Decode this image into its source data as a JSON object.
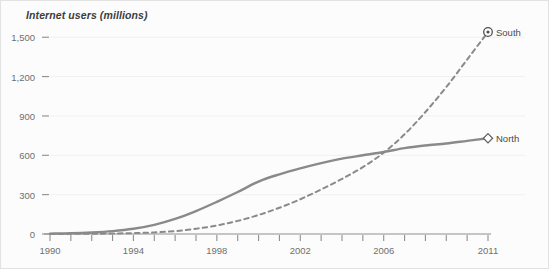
{
  "chart_data": {
    "type": "line",
    "title": "Internet users (millions)",
    "xlabel": "",
    "ylabel": "Internet users (millions)",
    "xlim": [
      1990,
      2011
    ],
    "ylim": [
      0,
      1600
    ],
    "grid": true,
    "legend_position": "right-inline",
    "y_ticks": [
      0,
      300,
      600,
      900,
      1200,
      1500
    ],
    "y_tick_labels": [
      "0",
      "300",
      "600",
      "900",
      "1,200",
      "1,500"
    ],
    "x_ticks": [
      1990,
      1991,
      1992,
      1993,
      1994,
      1995,
      1996,
      1997,
      1998,
      1999,
      2000,
      2001,
      2002,
      2003,
      2004,
      2005,
      2006,
      2007,
      2008,
      2009,
      2010,
      2011
    ],
    "x_tick_labels": [
      "1990",
      "1994",
      "1998",
      "2002",
      "2006",
      "2011"
    ],
    "x_labelled_ticks": [
      1990,
      1994,
      1998,
      2002,
      2006,
      2011
    ],
    "x": [
      1990,
      1991,
      1992,
      1993,
      1994,
      1995,
      1996,
      1997,
      1998,
      1999,
      2000,
      2001,
      2002,
      2003,
      2004,
      2005,
      2006,
      2007,
      2008,
      2009,
      2010,
      2011
    ],
    "series": [
      {
        "name": "North",
        "label": "North",
        "style": "solid",
        "color": "#8a8a8a",
        "marker": "diamond",
        "values": [
          3,
          6,
          12,
          22,
          40,
          70,
          115,
          175,
          245,
          320,
          400,
          455,
          500,
          540,
          575,
          600,
          625,
          655,
          675,
          690,
          710,
          730
        ]
      },
      {
        "name": "South",
        "label": "South",
        "style": "dashed",
        "color": "#8a8a8a",
        "marker": "circle-dot",
        "values": [
          0,
          1,
          2,
          4,
          7,
          12,
          22,
          40,
          65,
          100,
          145,
          200,
          265,
          340,
          420,
          510,
          620,
          760,
          930,
          1120,
          1330,
          1540
        ]
      }
    ],
    "annotations": {
      "crossover_year": 2006,
      "crossover_value": 625
    }
  }
}
